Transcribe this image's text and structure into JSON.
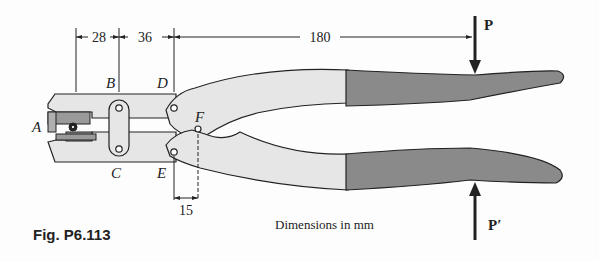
{
  "figure": {
    "caption": "Fig. P6.113",
    "note": "Dimensions in mm",
    "colors": {
      "body_fill": "#e6e6e6",
      "grip_fill": "#8a8a8a",
      "outline": "#222222",
      "jaw_fill": "#9a9a9a"
    }
  },
  "points": {
    "A": "A",
    "B": "B",
    "C": "C",
    "D": "D",
    "E": "E",
    "F": "F"
  },
  "dimensions": {
    "ab": "28",
    "bd": "36",
    "dp": "180",
    "ef": "15"
  },
  "forces": {
    "top": "P",
    "bottom": "P′"
  }
}
